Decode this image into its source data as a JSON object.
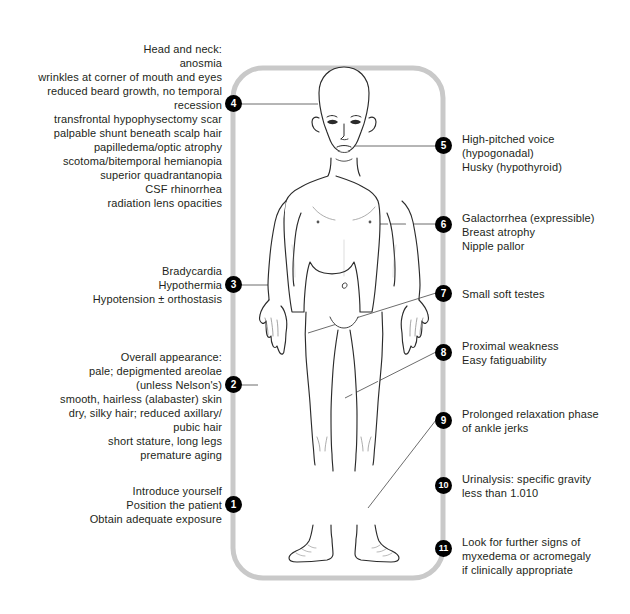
{
  "diagram": {
    "figure_name": "anatomical-male-figure",
    "track_color": "#c9c9c9",
    "marker_color": "#000000",
    "marker_text_color": "#ffffff",
    "leader_color": "#6d6d6d",
    "background": "#ffffff"
  },
  "markers": [
    {
      "number": "1",
      "side": "left",
      "text": "Introduce yourself\nPosition the patient\nObtain adequate exposure"
    },
    {
      "number": "2",
      "side": "left",
      "text": "Overall appearance:\npale; depigmented areolae\n(unless Nelson's)\nsmooth, hairless (alabaster) skin\ndry, silky hair; reduced axillary/\npubic hair\nshort stature, long legs\npremature aging"
    },
    {
      "number": "3",
      "side": "left",
      "text": "Bradycardia\nHypothermia\nHypotension ± orthostasis"
    },
    {
      "number": "4",
      "side": "left",
      "text": "Head and neck:\nanosmia\nwrinkles at corner of mouth and eyes\nreduced beard growth, no temporal\nrecession\ntransfrontal hypophysectomy scar\npalpable shunt beneath scalp hair\npapilledema/optic atrophy\nscotoma/bitemporal hemianopia\nsuperior quadrantanopia\nCSF rhinorrhea\nradiation lens opacities"
    },
    {
      "number": "5",
      "side": "right",
      "text": "High-pitched voice\n   (hypogonadal)\nHusky (hypothyroid)"
    },
    {
      "number": "6",
      "side": "right",
      "text": "Galactorrhea (expressible)\nBreast atrophy\nNipple pallor"
    },
    {
      "number": "7",
      "side": "right",
      "text": "Small soft testes"
    },
    {
      "number": "8",
      "side": "right",
      "text": "Proximal weakness\nEasy fatiguability"
    },
    {
      "number": "9",
      "side": "right",
      "text": "Prolonged relaxation phase\n   of ankle jerks"
    },
    {
      "number": "10",
      "side": "right",
      "text": "Urinalysis: specific gravity\n   less than 1.010"
    },
    {
      "number": "11",
      "side": "right",
      "text": "Look for further signs of\n   myxedema or acromegaly\n   if clinically appropriate"
    }
  ]
}
